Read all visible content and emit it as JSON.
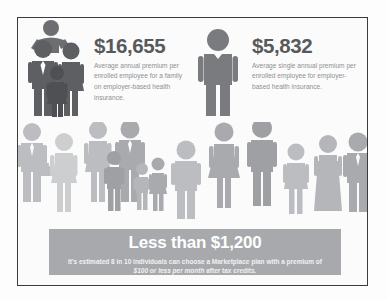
{
  "frame": {
    "border_color": "#3b3b3b",
    "background": "#fbfbfb"
  },
  "stats": [
    {
      "id": "family",
      "icon": "family-of-four-icon",
      "amount": "$16,655",
      "description": "Average annual premium per enrolled employee for a family on employer-based health insurance."
    },
    {
      "id": "single",
      "icon": "single-person-icon",
      "amount": "$5,832",
      "description": "Average single annual premium per enrolled employee for employer-based health insurance."
    }
  ],
  "crowd": {
    "label": "crowd-of-people-illustration",
    "figure_count": 14
  },
  "banner": {
    "title": "Less than $1,200",
    "sub_before": "It's estimated 8 in 10 individuals can choose a Marketplace plan with a premium of ",
    "sub_em": "$100 or less per month",
    "sub_after": " after tax credits.",
    "background_color": "#a7a9ac",
    "text_color": "#ffffff"
  },
  "colors": {
    "amount_text": "#58595b",
    "body_text": "#8e9093",
    "figure_dark": "#6d6e71",
    "figure_light": "#d3d4d6"
  }
}
